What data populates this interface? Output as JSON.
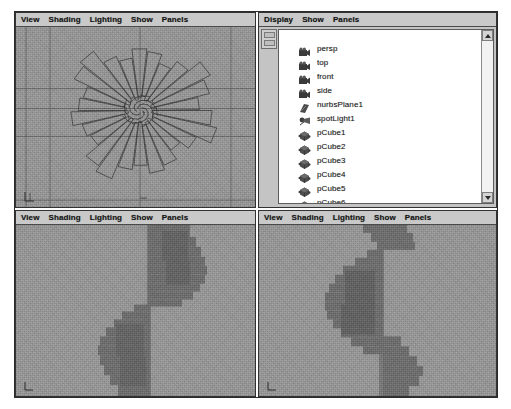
{
  "app": {
    "title": "Maya Four-Panel Layout",
    "background_color": "#ffffff",
    "frame_border_color": "#2b2b2b"
  },
  "panels": {
    "persp": {
      "name": "perspective-viewport-panel",
      "menu": [
        "View",
        "Shading",
        "Lighting",
        "Show",
        "Panels"
      ],
      "viewport_bg": "#9c9c9c",
      "wireframe_color": "#3b3b3b",
      "axis_gizmo": "xyz-axis-indicator"
    },
    "outliner": {
      "name": "outliner-panel",
      "menu": [
        "Display",
        "Show",
        "Panels"
      ],
      "list_bg": "#ffffff",
      "items": [
        {
          "label": "persp",
          "icon": "camera-icon"
        },
        {
          "label": "top",
          "icon": "camera-icon"
        },
        {
          "label": "front",
          "icon": "camera-icon"
        },
        {
          "label": "side",
          "icon": "camera-icon"
        },
        {
          "label": "nurbsPlane1",
          "icon": "nurbs-plane-icon"
        },
        {
          "label": "spotLight1",
          "icon": "spotlight-icon"
        },
        {
          "label": "pCube1",
          "icon": "mesh-icon"
        },
        {
          "label": "pCube2",
          "icon": "mesh-icon"
        },
        {
          "label": "pCube3",
          "icon": "mesh-icon"
        },
        {
          "label": "pCube4",
          "icon": "mesh-icon"
        },
        {
          "label": "pCube5",
          "icon": "mesh-icon"
        },
        {
          "label": "pCube6",
          "icon": "mesh-icon"
        },
        {
          "label": "pCube7",
          "icon": "mesh-icon"
        },
        {
          "label": "pCube8",
          "icon": "mesh-icon"
        }
      ],
      "scrollbar": {
        "up_icon": "scroll-up-arrow-icon",
        "down_icon": "scroll-down-arrow-icon"
      }
    },
    "front": {
      "name": "front-shaded-viewport-panel",
      "menu": [
        "View",
        "Shading",
        "Lighting",
        "Show",
        "Panels"
      ],
      "viewport_bg": "#9c9c9c",
      "shape_color": "#6b6b6b",
      "axis_gizmo": "xyz-axis-indicator"
    },
    "side": {
      "name": "side-shaded-viewport-panel",
      "menu": [
        "View",
        "Shading",
        "Lighting",
        "Show",
        "Panels"
      ],
      "viewport_bg": "#9c9c9c",
      "shape_color": "#6b6b6b",
      "axis_gizmo": "xyz-axis-indicator"
    }
  }
}
